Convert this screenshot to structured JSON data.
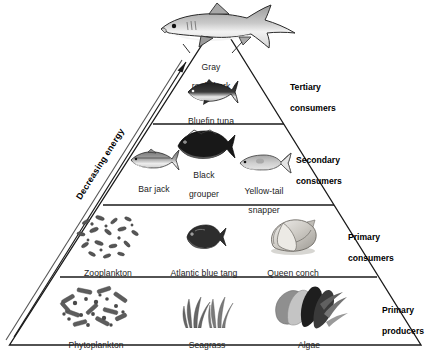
{
  "diagram": {
    "type": "trophic-pyramid",
    "background": "#ffffff",
    "line_color": "#1a1a1a",
    "axis_annotation": {
      "text": "Decreasing energy",
      "direction": "upward",
      "position": "left-outside-edge",
      "arrow": "up-arrow-icon"
    },
    "levels": [
      {
        "level": 4,
        "tier_label": "Tertiary\nconsumers",
        "tier_label_line1": "Tertiary",
        "tier_label_line2": "consumers",
        "organisms": [
          {
            "name": "Gray\nreef shark",
            "line1": "Gray",
            "line2": "reef shark",
            "icon": "shark-icon"
          },
          {
            "name": "Bluefin tuna",
            "line1": "Bluefin tuna",
            "line2": "",
            "icon": "tuna-icon"
          }
        ]
      },
      {
        "level": 3,
        "tier_label": "Secondary\nconsumers",
        "tier_label_line1": "Secondary",
        "tier_label_line2": "consumers",
        "organisms": [
          {
            "name": "Bar jack",
            "line1": "Bar jack",
            "line2": "",
            "icon": "bar-jack-icon"
          },
          {
            "name": "Black\ngrouper",
            "line1": "Black",
            "line2": "grouper",
            "icon": "black-grouper-icon"
          },
          {
            "name": "Yellow-tail\nsnapper",
            "line1": "Yellow-tail",
            "line2": "snapper",
            "icon": "yellowtail-snapper-icon"
          }
        ]
      },
      {
        "level": 2,
        "tier_label": "Primary\nconsumers",
        "tier_label_line1": "Primary",
        "tier_label_line2": "consumers",
        "organisms": [
          {
            "name": "Zooplankton",
            "line1": "Zooplankton",
            "line2": "",
            "icon": "zooplankton-icon"
          },
          {
            "name": "Atlantic blue tang",
            "line1": "Atlantic blue tang",
            "line2": "",
            "icon": "blue-tang-icon"
          },
          {
            "name": "Queen conch",
            "line1": "Queen conch",
            "line2": "",
            "icon": "queen-conch-icon"
          }
        ]
      },
      {
        "level": 1,
        "tier_label": "Primary\nproducers",
        "tier_label_line1": "Primary",
        "tier_label_line2": "producers",
        "organisms": [
          {
            "name": "Phytoplankton",
            "line1": "Phytoplankton",
            "line2": "",
            "icon": "phytoplankton-icon"
          },
          {
            "name": "Seagrass",
            "line1": "Seagrass",
            "line2": "",
            "icon": "seagrass-icon"
          },
          {
            "name": "Algae",
            "line1": "Algae",
            "line2": "",
            "icon": "algae-icon"
          }
        ]
      }
    ]
  }
}
